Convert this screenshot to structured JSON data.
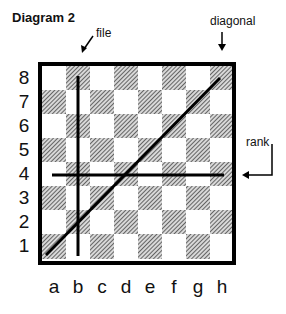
{
  "title": "Diagram 2",
  "annotations": {
    "file": "file",
    "diagonal": "diagonal",
    "rank": "rank"
  },
  "board": {
    "ranks": [
      "8",
      "7",
      "6",
      "5",
      "4",
      "3",
      "2",
      "1"
    ],
    "files": [
      "a",
      "b",
      "c",
      "d",
      "e",
      "f",
      "g",
      "h"
    ],
    "light_color": "#ffffff",
    "dark_pattern": "hatched",
    "border_color": "#000000"
  },
  "lines": {
    "file_line": "b-file vertical line",
    "rank_line": "4th rank horizontal line",
    "diagonal_line": "a1-h8 diagonal line"
  }
}
